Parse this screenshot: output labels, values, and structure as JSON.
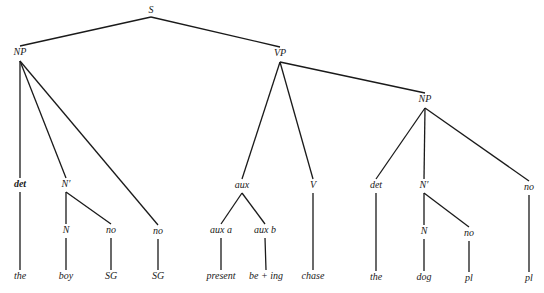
{
  "diagram": {
    "type": "syntax-tree",
    "nodes": [
      {
        "id": "S",
        "label": "S",
        "x": 151,
        "y": 11,
        "top": 17
      },
      {
        "id": "NP1",
        "label": "NP",
        "x": 20,
        "y": 53,
        "top": 61
      },
      {
        "id": "VP",
        "label": "VP",
        "x": 280,
        "y": 54,
        "top": 62
      },
      {
        "id": "NP2",
        "label": "NP",
        "x": 425,
        "y": 100,
        "top": 108
      },
      {
        "id": "det1",
        "label": "det",
        "x": 20,
        "y": 185,
        "bold": true
      },
      {
        "id": "Nbar1",
        "label": "N′",
        "x": 66,
        "y": 185
      },
      {
        "id": "no1",
        "label": "no",
        "x": 158,
        "y": 232
      },
      {
        "id": "N1",
        "label": "N",
        "x": 66,
        "y": 231
      },
      {
        "id": "no2",
        "label": "no",
        "x": 111,
        "y": 231
      },
      {
        "id": "aux",
        "label": "aux",
        "x": 242,
        "y": 186
      },
      {
        "id": "V",
        "label": "V",
        "x": 313,
        "y": 186
      },
      {
        "id": "auxa",
        "label": "aux a",
        "x": 221,
        "y": 231
      },
      {
        "id": "auxb",
        "label": "aux b",
        "x": 265,
        "y": 231
      },
      {
        "id": "det2",
        "label": "det",
        "x": 376,
        "y": 186
      },
      {
        "id": "Nbar2",
        "label": "N′",
        "x": 424,
        "y": 186
      },
      {
        "id": "no3",
        "label": "no",
        "x": 529,
        "y": 188
      },
      {
        "id": "N2",
        "label": "N",
        "x": 424,
        "y": 232
      },
      {
        "id": "no4",
        "label": "no",
        "x": 469,
        "y": 234
      },
      {
        "id": "w_the1",
        "label": "the",
        "x": 20,
        "y": 277
      },
      {
        "id": "w_boy",
        "label": "boy",
        "x": 66,
        "y": 277
      },
      {
        "id": "w_SG1",
        "label": "SG",
        "x": 111,
        "y": 277
      },
      {
        "id": "w_SG2",
        "label": "SG",
        "x": 158,
        "y": 277
      },
      {
        "id": "w_present",
        "label": "present",
        "x": 221,
        "y": 277
      },
      {
        "id": "w_being",
        "label": "be + ing",
        "x": 266,
        "y": 277
      },
      {
        "id": "w_chase",
        "label": "chase",
        "x": 313,
        "y": 277
      },
      {
        "id": "w_the2",
        "label": "the",
        "x": 376,
        "y": 278
      },
      {
        "id": "w_dog",
        "label": "dog",
        "x": 424,
        "y": 278
      },
      {
        "id": "w_pl1",
        "label": "pl",
        "x": 469,
        "y": 279
      },
      {
        "id": "w_pl2",
        "label": "pl",
        "x": 529,
        "y": 279
      }
    ],
    "edges": [
      [
        "S",
        "NP1"
      ],
      [
        "S",
        "VP"
      ],
      [
        "NP1",
        "det1"
      ],
      [
        "NP1",
        "Nbar1"
      ],
      [
        "NP1",
        "no1"
      ],
      [
        "Nbar1",
        "N1"
      ],
      [
        "Nbar1",
        "no2"
      ],
      [
        "det1",
        "w_the1"
      ],
      [
        "N1",
        "w_boy"
      ],
      [
        "no2",
        "w_SG1"
      ],
      [
        "no1",
        "w_SG2"
      ],
      [
        "VP",
        "aux"
      ],
      [
        "VP",
        "V"
      ],
      [
        "VP",
        "NP2"
      ],
      [
        "aux",
        "auxa"
      ],
      [
        "aux",
        "auxb"
      ],
      [
        "auxa",
        "w_present"
      ],
      [
        "auxb",
        "w_being"
      ],
      [
        "V",
        "w_chase"
      ],
      [
        "NP2",
        "det2"
      ],
      [
        "NP2",
        "Nbar2"
      ],
      [
        "NP2",
        "no3"
      ],
      [
        "Nbar2",
        "N2"
      ],
      [
        "Nbar2",
        "no4"
      ],
      [
        "det2",
        "w_the2"
      ],
      [
        "N2",
        "w_dog"
      ],
      [
        "no4",
        "w_pl1"
      ],
      [
        "no3",
        "w_pl2"
      ]
    ]
  }
}
